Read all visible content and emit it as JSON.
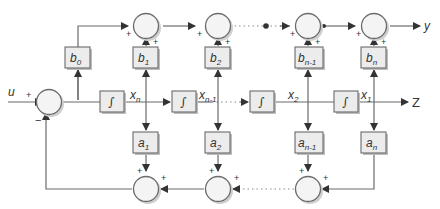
{
  "diagram": {
    "type": "block-diagram",
    "input_label": "u",
    "output_label": "y",
    "state_output_label": "Z",
    "input_sum_signs": {
      "input": "+",
      "feedback": "−"
    },
    "feedforward_gains": [
      {
        "base": "b",
        "sub": "0"
      },
      {
        "base": "b",
        "sub": "1"
      },
      {
        "base": "b",
        "sub": "2"
      },
      {
        "base": "b",
        "sub": "n-1"
      },
      {
        "base": "b",
        "sub": "n"
      }
    ],
    "feedback_gains": [
      {
        "base": "a",
        "sub": "1"
      },
      {
        "base": "a",
        "sub": "2"
      },
      {
        "base": "a",
        "sub": "n-1"
      },
      {
        "base": "a",
        "sub": "n"
      }
    ],
    "integrator_symbol": "∫",
    "states": [
      {
        "base": "x",
        "sub": "n"
      },
      {
        "base": "x",
        "sub": "n-1"
      },
      {
        "base": "x",
        "sub": "2"
      },
      {
        "base": "x",
        "sub": "1"
      }
    ],
    "sum_sign": "+"
  }
}
